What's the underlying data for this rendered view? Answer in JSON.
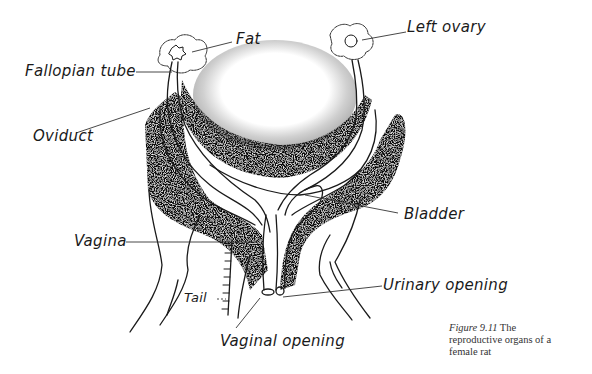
{
  "figure": {
    "caption_number": "Figure 9.11",
    "caption_line1_rest": "The",
    "caption_line2": "reproductive organs of a",
    "caption_line3": "female rat"
  },
  "labels": {
    "fat": "Fat",
    "left_ovary": "Left ovary",
    "fallopian_tube": "Fallopian tube",
    "oviduct": "Oviduct",
    "bladder": "Bladder",
    "vagina": "Vagina",
    "urinary_opening": "Urinary opening",
    "tail": "Tail",
    "vaginal_opening": "Vaginal opening"
  },
  "colors": {
    "ink": "#1a1a1a",
    "fat_tissue": "#111111"
  }
}
